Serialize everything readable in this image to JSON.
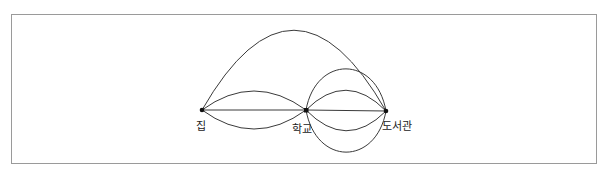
{
  "diagram": {
    "type": "multigraph",
    "nodes": [
      {
        "id": "home",
        "label": "집",
        "x": 202,
        "y": 110
      },
      {
        "id": "school",
        "label": "학교",
        "x": 306,
        "y": 110
      },
      {
        "id": "library",
        "label": "도서관",
        "x": 386,
        "y": 111
      }
    ],
    "edges": [
      {
        "from": "home",
        "to": "school",
        "count": 3
      },
      {
        "from": "school",
        "to": "library",
        "count": 5
      },
      {
        "from": "home",
        "to": "library",
        "count": 1
      }
    ],
    "stroke_color": "#3a3a3a",
    "frame_color": "#9a9a9a"
  }
}
